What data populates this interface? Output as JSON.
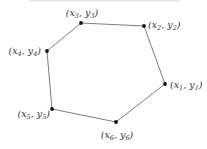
{
  "diagram": {
    "type": "polygon",
    "colors": {
      "edge": "#6e6e6e",
      "vertex": "#111111",
      "label": "#333333"
    },
    "vertices": [
      {
        "id": 1,
        "x": 165,
        "y": 84,
        "label_var_x": "x",
        "label_var_y": "y",
        "sub": "1",
        "label_x": 170,
        "label_y": 88,
        "anchor": "start"
      },
      {
        "id": 2,
        "x": 144,
        "y": 26,
        "label_var_x": "x",
        "label_var_y": "y",
        "sub": "2",
        "label_x": 148,
        "label_y": 28,
        "anchor": "start"
      },
      {
        "id": 3,
        "x": 81,
        "y": 23,
        "label_var_x": "x",
        "label_var_y": "y",
        "sub": "3",
        "label_x": 82,
        "label_y": 16,
        "anchor": "middle"
      },
      {
        "id": 4,
        "x": 47,
        "y": 51,
        "label_var_x": "x",
        "label_var_y": "y",
        "sub": "4",
        "label_x": 41,
        "label_y": 54,
        "anchor": "end"
      },
      {
        "id": 5,
        "x": 52,
        "y": 109,
        "label_var_x": "x",
        "label_var_y": "y",
        "sub": "5",
        "label_x": 50,
        "label_y": 117,
        "anchor": "end"
      },
      {
        "id": 6,
        "x": 116,
        "y": 122,
        "label_var_x": "x",
        "label_var_y": "y",
        "sub": "6",
        "label_x": 117,
        "label_y": 138,
        "anchor": "middle"
      }
    ],
    "labels": {
      "v1": "(x₁, y₁)",
      "v2": "(x₂, y₂)",
      "v3": "(x₃, y₃)",
      "v4": "(x₄, y₄)",
      "v5": "(x₅, y₅)",
      "v6": "(x₆, y₆)"
    }
  }
}
